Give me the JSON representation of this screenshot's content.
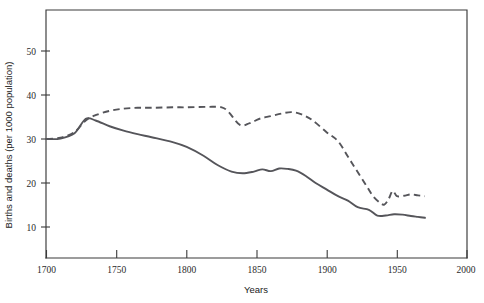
{
  "chart_data": {
    "type": "line",
    "title": "",
    "xlabel": "Years",
    "ylabel": "Births and deaths (per 1000 population)",
    "xlim": [
      1700,
      2000
    ],
    "ylim": [
      0,
      56
    ],
    "xticks": [
      1700,
      1750,
      1800,
      1850,
      1900,
      1950,
      2000
    ],
    "xticklabels": [
      "1700",
      "1750",
      "1800",
      "1850",
      "1900",
      "1950",
      "2000"
    ],
    "yticks": [
      10,
      20,
      30,
      40,
      50
    ],
    "yticklabels": [
      "10",
      "20",
      "30",
      "40",
      "50"
    ],
    "grid": false,
    "legend": "none",
    "series": [
      {
        "name": "births",
        "style": "dashed",
        "x": [
          1700,
          1710,
          1720,
          1728,
          1735,
          1745,
          1755,
          1765,
          1775,
          1790,
          1800,
          1815,
          1825,
          1830,
          1838,
          1845,
          1852,
          1860,
          1868,
          1875,
          1882,
          1890,
          1900,
          1908,
          1915,
          1921,
          1928,
          1933,
          1938,
          1941,
          1944,
          1947,
          1950,
          1955,
          1960,
          1965,
          1970
        ],
        "y": [
          30.0,
          30.3,
          31.6,
          34.2,
          35.4,
          36.4,
          36.9,
          37.1,
          37.1,
          37.2,
          37.2,
          37.3,
          37.2,
          36.1,
          33.2,
          33.6,
          34.6,
          35.2,
          35.8,
          36.1,
          35.6,
          34.2,
          31.5,
          29.5,
          26.0,
          23.0,
          19.5,
          17.0,
          15.5,
          15.1,
          16.3,
          18.2,
          17.0,
          17.1,
          17.4,
          17.2,
          17.0
        ]
      },
      {
        "name": "deaths",
        "style": "solid",
        "x": [
          1700,
          1710,
          1720,
          1728,
          1735,
          1745,
          1755,
          1765,
          1775,
          1790,
          1800,
          1812,
          1822,
          1832,
          1840,
          1848,
          1854,
          1860,
          1866,
          1872,
          1878,
          1885,
          1892,
          1900,
          1908,
          1915,
          1922,
          1930,
          1936,
          1942,
          1948,
          1954,
          1960,
          1965,
          1970
        ],
        "y": [
          30.0,
          30.1,
          31.3,
          34.6,
          34.2,
          32.9,
          31.9,
          31.1,
          30.4,
          29.3,
          28.2,
          26.2,
          24.1,
          22.6,
          22.2,
          22.6,
          23.1,
          22.7,
          23.3,
          23.2,
          22.8,
          21.6,
          20.0,
          18.5,
          17.0,
          16.0,
          14.5,
          13.9,
          12.6,
          12.6,
          12.9,
          12.8,
          12.5,
          12.3,
          12.1
        ]
      }
    ]
  },
  "axes": {
    "y_axis_title": "Births and deaths (per 1000 population)",
    "x_axis_title": "Years"
  }
}
